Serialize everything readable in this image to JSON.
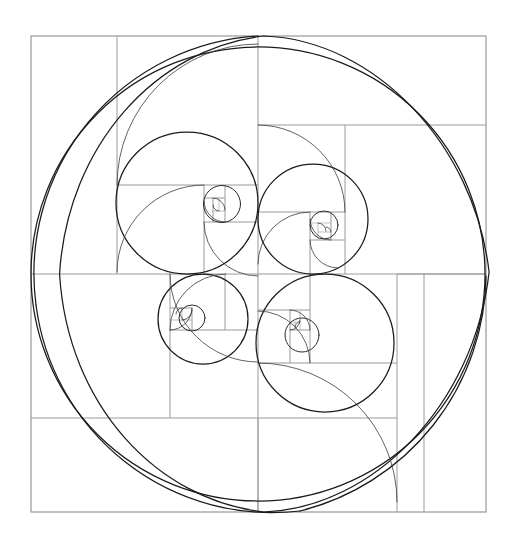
{
  "figure": {
    "background_color": "#ffffff",
    "line_color": "#1b1b1b",
    "grid_color": "#9a9a9a",
    "canvas": {
      "width": 516,
      "height": 541
    }
  },
  "chart_data": {
    "type": "diagram",
    "subtitle": "",
    "xlabel": "",
    "ylabel": "",
    "legend": [],
    "annotations": [],
    "grid": true,
    "ratio": 1.6180339887,
    "frame": {
      "x": 31,
      "y": 36,
      "width": 455,
      "height": 476
    },
    "center": {
      "x": 258,
      "y": 274
    },
    "vertical_gridlines": [
      31,
      117,
      170,
      204,
      225,
      258,
      310,
      345,
      397,
      424,
      486
    ],
    "horizontal_gridlines": [
      36,
      125,
      185,
      222,
      240,
      274,
      310,
      330,
      363,
      418,
      512
    ],
    "circles": [
      {
        "name": "outer-circle",
        "cx": 258,
        "cy": 274,
        "r": 227,
        "weight": 1.25
      },
      {
        "name": "crescent-arc-outer",
        "cx": 290,
        "cy": 274,
        "r": 238,
        "weight": 1.25
      },
      {
        "name": "upper-left-circle",
        "cx": 187,
        "cy": 203,
        "r": 71,
        "weight": 1.25
      },
      {
        "name": "upper-right-circle",
        "cx": 313,
        "cy": 219,
        "r": 55,
        "weight": 1.25
      },
      {
        "name": "lower-left-circle",
        "cx": 203,
        "cy": 319,
        "r": 45,
        "weight": 1.25
      },
      {
        "name": "lower-right-circle",
        "cx": 325,
        "cy": 343,
        "r": 69,
        "weight": 1.25
      },
      {
        "name": "nest-ul-small",
        "cx": 222,
        "cy": 204,
        "r": 18,
        "weight": 1.0
      },
      {
        "name": "nest-ur-small",
        "cx": 324,
        "cy": 225,
        "r": 14,
        "weight": 1.0
      },
      {
        "name": "nest-ll-small",
        "cx": 192,
        "cy": 318,
        "r": 13,
        "weight": 1.0
      },
      {
        "name": "nest-lr-small",
        "cx": 302,
        "cy": 335,
        "r": 17,
        "weight": 1.0
      }
    ],
    "spiral_nests": 4,
    "squares_count": 26
  }
}
